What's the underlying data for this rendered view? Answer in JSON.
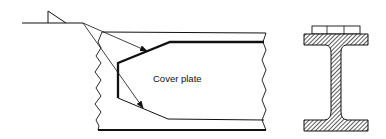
{
  "diagram": {
    "type": "engineering-drawing",
    "labels": {
      "cover_plate": "Cover plate"
    },
    "components": [
      {
        "id": "weld-symbol",
        "description": "fillet weld symbol on reference line with two arrow leaders"
      },
      {
        "id": "beam-flange-plan",
        "description": "plan view of beam flange with broken ends"
      },
      {
        "id": "cover-plate-outline",
        "description": "tapered cover plate outline (heavy line)"
      },
      {
        "id": "i-beam-section",
        "description": "hatched I-beam cross section with cover plate on top flange"
      }
    ],
    "colors": {
      "line": "#111111",
      "background": "#ffffff"
    }
  }
}
